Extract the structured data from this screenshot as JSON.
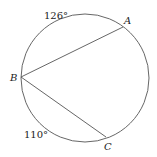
{
  "diagram": {
    "type": "circle-with-chords",
    "circle": {
      "cx": 85,
      "cy": 78,
      "r": 64
    },
    "points": {
      "A": {
        "label": "A",
        "x": 123,
        "y": 27
      },
      "B": {
        "label": "B",
        "x": 21,
        "y": 77
      },
      "C": {
        "label": "C",
        "x": 106,
        "y": 137
      }
    },
    "chords": [
      {
        "from": "B",
        "to": "A"
      },
      {
        "from": "B",
        "to": "C"
      }
    ],
    "arc_labels": [
      {
        "text": "126°",
        "arc": "BA"
      },
      {
        "text": "110°",
        "arc": "BC"
      }
    ],
    "colors": {
      "stroke": "#555555",
      "text": "#222222"
    }
  }
}
